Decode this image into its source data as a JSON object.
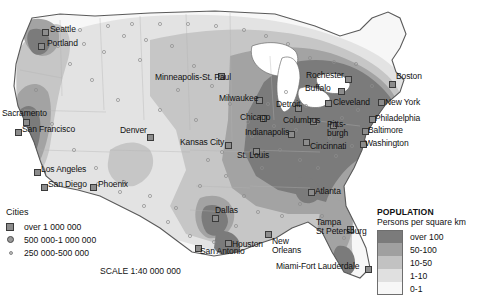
{
  "map": {
    "title": "United States population density map",
    "scale_text": "SCALE 1:40 000 000",
    "background_color": "#ffffff"
  },
  "cities_legend": {
    "title": "Cities",
    "items": [
      {
        "marker": "square-marker",
        "label": "over 1 000 000"
      },
      {
        "marker": "circle-marker",
        "label": "500 000-1 000 000"
      },
      {
        "marker": "dot-marker",
        "label": "250 000-500 000"
      }
    ]
  },
  "population_legend": {
    "header": "POPULATION",
    "subheader": "Persons per square km",
    "classes": [
      {
        "label": "over 100",
        "color": "#7b7b7b"
      },
      {
        "label": "50-100",
        "color": "#a0a0a0"
      },
      {
        "label": "10-50",
        "color": "#c2c2c2"
      },
      {
        "label": "1-10",
        "color": "#e0e0e0"
      },
      {
        "label": "0-1",
        "color": "#f7f7f7"
      }
    ]
  },
  "cities": [
    {
      "name": "Seattle",
      "label": "Seattle",
      "marker": "square",
      "mx": 42,
      "my": 29,
      "lx": 50,
      "ly": 25
    },
    {
      "name": "Portland",
      "label": "Portland",
      "marker": "square",
      "mx": 38,
      "my": 43,
      "lx": 47,
      "ly": 39
    },
    {
      "name": "Sacramento",
      "label": "Sacramento",
      "marker": "square",
      "mx": 23,
      "my": 119,
      "lx": 2,
      "ly": 109
    },
    {
      "name": "San Francisco",
      "label": "San Francisco",
      "marker": "square",
      "mx": 15,
      "my": 129,
      "lx": 22,
      "ly": 125
    },
    {
      "name": "Los Angeles",
      "label": "Los Angeles",
      "marker": "square",
      "mx": 34,
      "my": 169,
      "lx": 41,
      "ly": 165
    },
    {
      "name": "San Diego",
      "label": "San Diego",
      "marker": "square",
      "mx": 41,
      "my": 184,
      "lx": 48,
      "ly": 180
    },
    {
      "name": "Phoenix",
      "label": "Phoenix",
      "marker": "square",
      "mx": 90,
      "my": 184,
      "lx": 98,
      "ly": 180
    },
    {
      "name": "Denver",
      "label": "Denver",
      "marker": "square",
      "mx": 147,
      "my": 134,
      "lx": 120,
      "ly": 126
    },
    {
      "name": "Minneapolis-St. Paul",
      "label": "Minneapolis-St. Paul",
      "marker": "square",
      "mx": 218,
      "my": 73,
      "lx": 155,
      "ly": 73
    },
    {
      "name": "Milwaukee",
      "label": "Milwaukee",
      "marker": "square",
      "mx": 256,
      "my": 97,
      "lx": 219,
      "ly": 94
    },
    {
      "name": "Chicago",
      "label": "Chicago",
      "marker": "square",
      "mx": 260,
      "my": 115,
      "lx": 240,
      "ly": 113
    },
    {
      "name": "Detroit",
      "label": "Detroit",
      "marker": "square",
      "mx": 295,
      "my": 105,
      "lx": 276,
      "ly": 100
    },
    {
      "name": "Indianapolis",
      "label": "Indianapolis",
      "marker": "square",
      "mx": 288,
      "my": 131,
      "lx": 245,
      "ly": 128
    },
    {
      "name": "Columbus",
      "label": "Columbus",
      "marker": "square",
      "mx": 310,
      "my": 118,
      "lx": 283,
      "ly": 116
    },
    {
      "name": "Cincinnati",
      "label": "Cincinnati",
      "marker": "square",
      "mx": 303,
      "my": 139,
      "lx": 310,
      "ly": 142
    },
    {
      "name": "Kansas City",
      "label": "Kansas City",
      "marker": "square",
      "mx": 225,
      "my": 142,
      "lx": 180,
      "ly": 138
    },
    {
      "name": "St. Louis",
      "label": "St. Louis",
      "marker": "square",
      "mx": 253,
      "my": 148,
      "lx": 237,
      "ly": 151
    },
    {
      "name": "Rochester",
      "label": "Rochester",
      "marker": "square",
      "mx": 345,
      "my": 76,
      "lx": 306,
      "ly": 71
    },
    {
      "name": "Buffalo",
      "label": "Buffalo",
      "marker": "square",
      "mx": 338,
      "my": 88,
      "lx": 305,
      "ly": 84
    },
    {
      "name": "Cleveland",
      "label": "Cleveland",
      "marker": "square",
      "mx": 325,
      "my": 100,
      "lx": 333,
      "ly": 98
    },
    {
      "name": "Boston",
      "label": "Boston",
      "marker": "square",
      "mx": 389,
      "my": 81,
      "lx": 396,
      "ly": 72
    },
    {
      "name": "New York",
      "label": "New York",
      "marker": "square",
      "mx": 378,
      "my": 99,
      "lx": 385,
      "ly": 98
    },
    {
      "name": "Philadelphia",
      "label": "Philadelphia",
      "marker": "square",
      "mx": 369,
      "my": 116,
      "lx": 375,
      "ly": 114
    },
    {
      "name": "Pittsburgh",
      "label": "Pitts-\nburgh",
      "marker": "square",
      "mx": 330,
      "my": 122,
      "lx": 327,
      "ly": 120
    },
    {
      "name": "Baltimore",
      "label": "Baltimore",
      "marker": "square",
      "mx": 362,
      "my": 128,
      "lx": 368,
      "ly": 126
    },
    {
      "name": "Washington",
      "label": "Washington",
      "marker": "square",
      "mx": 360,
      "my": 141,
      "lx": 365,
      "ly": 139
    },
    {
      "name": "Atlanta",
      "label": "Atlanta",
      "marker": "square",
      "mx": 308,
      "my": 189,
      "lx": 315,
      "ly": 187
    },
    {
      "name": "Dallas",
      "label": "Dallas",
      "marker": "square",
      "mx": 212,
      "my": 215,
      "lx": 215,
      "ly": 206
    },
    {
      "name": "Houston",
      "label": "Houston",
      "marker": "square",
      "mx": 225,
      "my": 240,
      "lx": 232,
      "ly": 240
    },
    {
      "name": "San Antonio",
      "label": "San Antonio",
      "marker": "square",
      "mx": 195,
      "my": 245,
      "lx": 200,
      "ly": 247
    },
    {
      "name": "New Orleans",
      "label": "New\nOrleans",
      "marker": "square",
      "mx": 265,
      "my": 231,
      "lx": 272,
      "ly": 237
    },
    {
      "name": "Tampa-St Petersburg",
      "label": "Tampa\nSt Petersburg",
      "marker": "square",
      "mx": 347,
      "my": 226,
      "lx": 316,
      "ly": 218
    },
    {
      "name": "Miami-Fort Lauderdale",
      "label": "Miami-Fort Lauderdale",
      "marker": "square",
      "mx": 365,
      "my": 266,
      "lx": 276,
      "ly": 262
    }
  ]
}
